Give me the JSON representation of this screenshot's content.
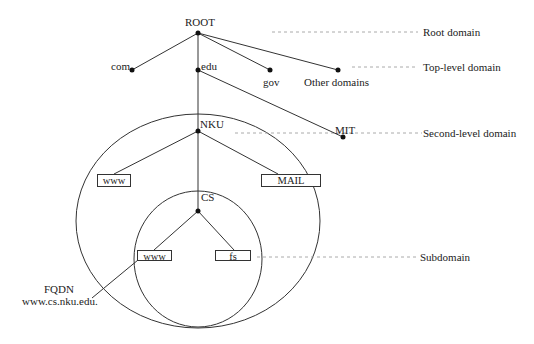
{
  "diagram": {
    "nodes": {
      "root": "ROOT",
      "com": "com",
      "edu": "edu",
      "gov": "gov",
      "other": "Other domains",
      "nku": "NKU",
      "mit": "MIT",
      "nku_www": "www",
      "nku_mail": "MAIL",
      "cs": "CS",
      "cs_www": "www",
      "cs_fs": "fs"
    },
    "levels": {
      "root": "Root domain",
      "top": "Top-level domain",
      "second": "Second-level domain",
      "sub": "Subdomain"
    },
    "fqdn": {
      "title": "FQDN",
      "value": "www.cs.nku.edu."
    },
    "colors": {
      "line": "#333333",
      "dashed": "#aaaaaa",
      "text": "#222222"
    }
  }
}
